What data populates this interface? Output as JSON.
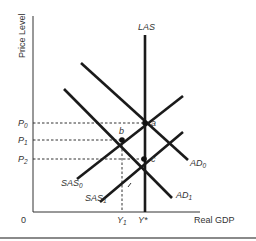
{
  "diagram": {
    "type": "AS-AD model",
    "y_axis_label": "Price Level",
    "x_axis_label": "Real GDP",
    "origin_label": "0",
    "price_levels": [
      {
        "name": "P",
        "sub": "0"
      },
      {
        "name": "P",
        "sub": "1"
      },
      {
        "name": "P",
        "sub": "2"
      }
    ],
    "gdp_levels": [
      {
        "name": "Y",
        "sub": "1"
      },
      {
        "name": "Y*",
        "sub": ""
      }
    ],
    "curves": {
      "las": {
        "label": "LAS"
      },
      "ad0": {
        "name": "AD",
        "sub": "0"
      },
      "ad1": {
        "name": "AD",
        "sub": "1"
      },
      "sas0": {
        "name": "SAS",
        "sub": "0"
      },
      "sas1": {
        "name": "SAS",
        "sub": "1"
      }
    },
    "points": {
      "a": "a",
      "b": "b",
      "c": "c"
    },
    "colors": {
      "line": "#1a1a1a",
      "text": "#333333",
      "bottom_rule": "#8a8a8a"
    }
  }
}
